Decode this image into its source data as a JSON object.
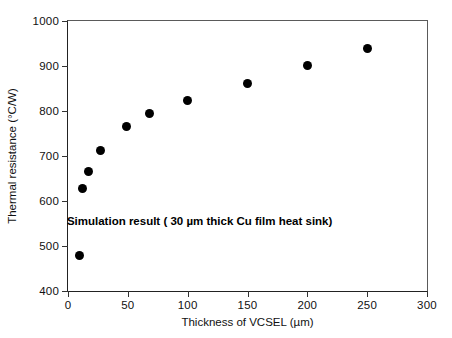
{
  "chart_data": {
    "type": "scatter",
    "title": "",
    "xlabel": "Thickness of VCSEL (µm)",
    "ylabel": "Thermal resistance (°C/W)",
    "xlim": [
      0,
      300
    ],
    "ylim": [
      400,
      1000
    ],
    "xticks": [
      0,
      50,
      100,
      150,
      200,
      250,
      300
    ],
    "yticks": [
      400,
      500,
      600,
      700,
      800,
      900,
      1000
    ],
    "xtick_labels": [
      "0",
      "50",
      "100",
      "150",
      "200",
      "250",
      "300"
    ],
    "ytick_labels": [
      "400",
      "500",
      "600",
      "700",
      "800",
      "900",
      "1000"
    ],
    "grid": false,
    "legend": null,
    "marker": "filled-circle",
    "marker_color": "#000000",
    "series": [
      {
        "name": "Simulation result",
        "x": [
          10,
          12,
          17,
          27,
          49,
          68,
          100,
          150,
          200,
          250
        ],
        "y": [
          480,
          628,
          665,
          712,
          765,
          795,
          824,
          862,
          901,
          940
        ],
        "points": [
          {
            "x": 10,
            "y": 480
          },
          {
            "x": 12,
            "y": 628
          },
          {
            "x": 17,
            "y": 665
          },
          {
            "x": 27,
            "y": 712
          },
          {
            "x": 49,
            "y": 765
          },
          {
            "x": 68,
            "y": 795
          },
          {
            "x": 100,
            "y": 824
          },
          {
            "x": 150,
            "y": 862
          },
          {
            "x": 200,
            "y": 901
          },
          {
            "x": 250,
            "y": 940
          }
        ]
      }
    ],
    "annotations": [
      {
        "text": "Simulation result ( 30 µm thick Cu film heat sink)",
        "x": 110,
        "y": 555,
        "bold": true
      }
    ]
  }
}
